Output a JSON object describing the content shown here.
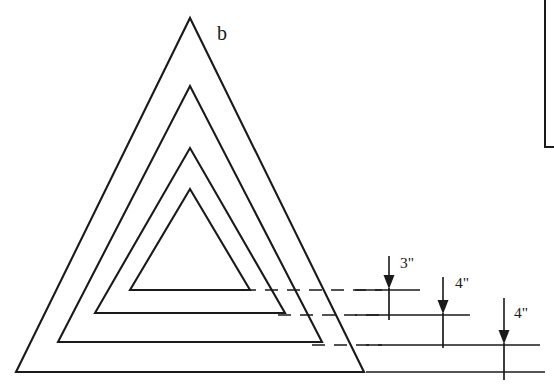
{
  "figure": {
    "label": "b",
    "label_position": {
      "x": 217,
      "y": 40
    }
  },
  "chart_data": {
    "type": "diagram",
    "title": "b",
    "nested_shapes": {
      "count": 4,
      "kind": "nested-triangles",
      "apex_x": 190,
      "triangles": [
        {
          "name": "outer-triangle",
          "apex_y": 18,
          "base_y": 372,
          "base_left_x": 16,
          "base_right_x": 364,
          "closed_base": true
        },
        {
          "name": "second-triangle",
          "apex_y": 86,
          "base_y": 342,
          "base_left_x": 58,
          "base_right_x": 322,
          "closed_base": true
        },
        {
          "name": "third-triangle",
          "apex_y": 148,
          "base_y": 313,
          "base_left_x": 95,
          "base_right_x": 285,
          "closed_base": true
        },
        {
          "name": "inner-triangle",
          "apex_y": 189,
          "base_y": 290,
          "base_left_x": 130,
          "base_right_x": 250,
          "closed_base": true
        }
      ]
    },
    "dimension_levels": [
      {
        "name": "level-1",
        "y": 290,
        "x_start": 355,
        "x_end": 420
      },
      {
        "name": "level-2",
        "y": 315,
        "x_start": 355,
        "x_end": 470
      },
      {
        "name": "level-3",
        "y": 345,
        "x_start": 366,
        "x_end": 540
      },
      {
        "name": "level-4",
        "y": 372,
        "x_start": 366,
        "x_end": 545
      }
    ],
    "leader_lines": [
      {
        "name": "leader-inner",
        "y": 290,
        "x_start": 243,
        "x_end": 382
      },
      {
        "name": "leader-third",
        "y": 315,
        "x_start": 278,
        "x_end": 382
      },
      {
        "name": "leader-second",
        "y": 345,
        "x_start": 312,
        "x_end": 382
      }
    ],
    "dimensions": [
      {
        "label": "3\"",
        "value": 3,
        "unit": "inch",
        "arrow_x": 389,
        "arrow_top_y": 256,
        "arrow_tip_y": 288,
        "text_x": 400,
        "text_y": 268
      },
      {
        "label": "4\"",
        "value": 4,
        "unit": "inch",
        "arrow_x": 443,
        "arrow_top_y": 277,
        "arrow_tip_y": 313,
        "text_x": 455,
        "text_y": 288
      },
      {
        "label": "4\"",
        "value": 4,
        "unit": "inch",
        "arrow_x": 504,
        "arrow_top_y": 298,
        "arrow_tip_y": 343,
        "text_x": 514,
        "text_y": 318
      }
    ],
    "riser_lines": [
      {
        "name": "riser-1",
        "x": 389,
        "y_top": 288,
        "y_bottom": 320
      },
      {
        "name": "riser-2",
        "x": 443,
        "y_top": 313,
        "y_bottom": 348
      },
      {
        "name": "riser-3",
        "x": 504,
        "y_top": 343,
        "y_bottom": 380
      }
    ],
    "frame_corner": {
      "name": "partial-frame",
      "vertical_x": 545,
      "vertical_y_top": 0,
      "vertical_y_bottom": 147,
      "horizontal_y": 147,
      "horizontal_x_start": 545,
      "horizontal_x_end": 554
    }
  }
}
